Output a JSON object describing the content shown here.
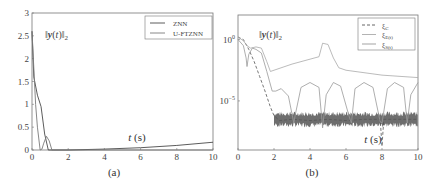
{
  "chart_data": [
    {
      "id": "a",
      "type": "line",
      "caption": "(a)",
      "title": "",
      "xlabel": "t (s)",
      "ylabel": "",
      "annotation": "||y(t)||2",
      "xlim": [
        0,
        10
      ],
      "ylim": [
        0,
        3
      ],
      "xticks": [
        0,
        2,
        4,
        6,
        8,
        10
      ],
      "yticks": [
        0,
        0.5,
        1,
        1.5,
        2,
        2.5,
        3
      ],
      "ytick_labels": [
        "0",
        "0.5",
        "1",
        "1.5",
        "2",
        "2.5",
        "3"
      ],
      "grid": false,
      "legend_position": "upper right",
      "series": [
        {
          "name": "ZNN",
          "color": "#4a4a4a",
          "x": [
            0,
            0.1,
            0.3,
            0.5,
            0.7,
            0.9,
            1.0,
            1.2,
            2,
            4,
            6,
            8,
            10
          ],
          "y": [
            2.6,
            1.6,
            1.2,
            0.95,
            0.35,
            0.0,
            0.0,
            0.0,
            0.0,
            0.02,
            0.05,
            0.1,
            0.17
          ]
        },
        {
          "name": "U-FTZNN",
          "color": "#7a7a7a",
          "x": [
            0,
            0.1,
            0.2,
            0.3,
            0.45,
            0.55,
            0.65,
            0.8,
            0.95,
            1.1,
            1.2,
            1.5,
            10
          ],
          "y": [
            2.6,
            1.8,
            1.0,
            0.5,
            0.0,
            0.02,
            0.15,
            0.3,
            0.2,
            0.0,
            0.0,
            0.0,
            0.0
          ]
        }
      ]
    },
    {
      "id": "b",
      "type": "line",
      "caption": "(b)",
      "title": "",
      "xlabel": "t (s)",
      "ylabel": "",
      "annotation": "||y(t)||2",
      "xlim": [
        0,
        10
      ],
      "yscale": "log",
      "ylim_exp": [
        -9,
        2
      ],
      "xticks": [
        0,
        2,
        4,
        6,
        8,
        10
      ],
      "yticks_exp": [
        0,
        -5
      ],
      "ytick_labels": [
        "10^0",
        "10^-5"
      ],
      "grid": false,
      "legend_position": "upper right",
      "series": [
        {
          "name": "ξC",
          "style": "dashed",
          "color": "#555555",
          "x_exp_desc": "log10 values",
          "x": [
            0,
            0.3,
            0.6,
            0.9,
            1.2,
            1.5,
            1.8,
            2.0,
            2.3,
            3,
            4,
            5,
            6,
            7,
            7.9,
            8.0,
            8.1,
            9,
            10
          ],
          "y": [
            0.2,
            0.0,
            -0.8,
            -1.8,
            -3.0,
            -4.2,
            -5.5,
            -6.2,
            -6.6,
            -6.5,
            -6.6,
            -6.5,
            -6.6,
            -6.5,
            -6.5,
            -8.7,
            -6.5,
            -6.5,
            -6.5
          ]
        },
        {
          "name": "ξE(t)",
          "style": "solid",
          "color": "#aaaaaa",
          "x": [
            0,
            0.3,
            0.5,
            0.7,
            1.0,
            1.3,
            1.6,
            1.8,
            2.0,
            3,
            4,
            4.5,
            4.7,
            5.0,
            5.3,
            5.6,
            6,
            7,
            8,
            9,
            10
          ],
          "y": [
            0.2,
            -0.1,
            -0.5,
            -0.7,
            -0.6,
            -0.7,
            -1.8,
            -2.6,
            -2.5,
            -2.0,
            -1.6,
            -1.4,
            -0.3,
            -0.4,
            -1.5,
            -2.3,
            -2.5,
            -2.7,
            -2.9,
            -3.0,
            -3.1
          ]
        },
        {
          "name": "ξS(t)",
          "style": "solid",
          "color": "#999999",
          "x": [
            0,
            0.3,
            0.45,
            0.5,
            0.6,
            0.8,
            1.0,
            1.3,
            1.6,
            1.9,
            2.1,
            2.4,
            2.8,
            3.1,
            3.2,
            3.5,
            4.0,
            4.5,
            4.7,
            4.9,
            5.3,
            5.7,
            6.2,
            6.3,
            6.5,
            7.0,
            7.5,
            7.9,
            8.0,
            8.3,
            8.7,
            9.2,
            9.4,
            9.6,
            10
          ],
          "y": [
            0.0,
            -0.5,
            -1.5,
            -2.2,
            -1.2,
            -0.7,
            -0.8,
            -1.1,
            -2.6,
            -4.2,
            -4.2,
            -4.0,
            -4.6,
            -6.8,
            -6.0,
            -3.9,
            -3.5,
            -3.9,
            -7.2,
            -4.5,
            -3.5,
            -3.8,
            -6.4,
            -6.8,
            -4.0,
            -3.5,
            -3.9,
            -6.7,
            -6.8,
            -4.0,
            -3.5,
            -3.9,
            -6.8,
            -4.5,
            -3.5
          ]
        }
      ],
      "noise_band": {
        "x_start": 2.0,
        "x_end": 10,
        "y_center": -6.5,
        "half_width": 0.45,
        "color": "#555555"
      }
    }
  ],
  "panels": {
    "a": {
      "caption": "(a)",
      "xlabel": "t (s)",
      "legend": [
        "ZNN",
        "U-FTZNN"
      ]
    },
    "b": {
      "caption": "(b)",
      "xlabel": "t (s)",
      "legend": [
        "ξC",
        "ξE(t)",
        "ξS(t)"
      ]
    }
  }
}
